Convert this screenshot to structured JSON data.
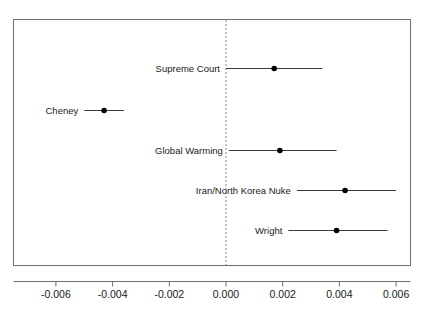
{
  "chart_data": {
    "type": "scatter",
    "title": "",
    "subtitle": "",
    "xlabel": "",
    "ylabel": "",
    "orientation": "horizontal",
    "grid": false,
    "legend": null,
    "xlim": [
      -0.0075,
      0.0069
    ],
    "xticks": [
      -0.006,
      -0.004,
      -0.002,
      0.0,
      0.002,
      0.004,
      0.006
    ],
    "xticklabels": [
      "-0.006",
      "-0.004",
      "-0.002",
      "0.000",
      "0.002",
      "0.004",
      "0.006"
    ],
    "reference_line": {
      "value": 0.0,
      "style": "dashed",
      "orientation": "vertical"
    },
    "categories": [
      "Supreme Court",
      "Cheney",
      "Global Warming",
      "Iran/North Korea Nuke",
      "Wright"
    ],
    "points": [
      {
        "label": "Supreme Court",
        "estimate": 0.0017,
        "ci_low": 0.0,
        "ci_high": 0.0034,
        "row": 1
      },
      {
        "label": "Cheney",
        "estimate": -0.0043,
        "ci_low": -0.005,
        "ci_high": -0.0036,
        "row": 2
      },
      {
        "label": "Global Warming",
        "estimate": 0.0019,
        "ci_low": 0.0001,
        "ci_high": 0.0039,
        "row": 3
      },
      {
        "label": "Iran/North Korea Nuke",
        "estimate": 0.0042,
        "ci_low": 0.0025,
        "ci_high": 0.006,
        "row": 4
      },
      {
        "label": "Wright",
        "estimate": 0.0039,
        "ci_low": 0.0022,
        "ci_high": 0.0057,
        "row": 5
      }
    ],
    "colors": {
      "point": "#000000",
      "interval": "#3a3a3a",
      "frame": "#6e6e6e",
      "reference": "#8a8a8a",
      "background": "#ffffff"
    }
  }
}
